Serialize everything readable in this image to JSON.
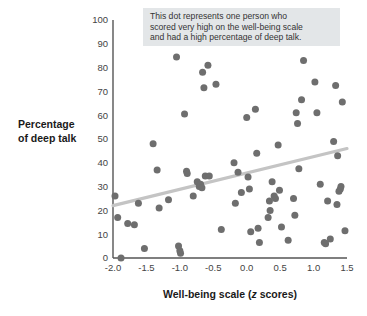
{
  "annotation": {
    "line1": "This dot represents one person who",
    "line2": "scored very high on the well-being scale",
    "line3": "and had a high percentage of deep talk.",
    "background": "#e3e6e8"
  },
  "colors": {
    "dot": "#6e6e6e",
    "trend_line": "#c4c4c4",
    "axis": "#555555",
    "tick_text": "#444444",
    "title_text": "#1a1a1a",
    "background": "#ffffff"
  },
  "chart_data": {
    "type": "scatter",
    "title": "",
    "xlabel": "Well-being scale (z scores)",
    "xlabel_plain": "Well-being scale (",
    "xlabel_italic": "z",
    "xlabel_tail": " scores)",
    "ylabel_line1": "Percentage",
    "ylabel_line2": "of deep talk",
    "xlim": [
      -2.0,
      1.5
    ],
    "ylim": [
      0,
      100
    ],
    "xticks": [
      -2.0,
      -1.5,
      -1.0,
      -0.5,
      0.0,
      0.5,
      1.0,
      1.5
    ],
    "xticklabels": [
      "-2.0",
      "-1.5",
      "-1.0",
      "-0.5",
      "0.0",
      "0.5",
      "1.0",
      "1.5"
    ],
    "yticks": [
      0,
      10,
      20,
      30,
      40,
      50,
      60,
      70,
      80,
      90,
      100
    ],
    "yticklabels": [
      "0",
      "10",
      "20",
      "30",
      "40",
      "50",
      "60",
      "70",
      "80",
      "90",
      "100"
    ],
    "grid": false,
    "legend": "none",
    "trend_line": {
      "x": [
        -2.0,
        1.5
      ],
      "y": [
        22.0,
        46.0
      ]
    },
    "points": [
      {
        "x": -1.97,
        "y": 26
      },
      {
        "x": -1.93,
        "y": 17
      },
      {
        "x": -1.88,
        "y": 0
      },
      {
        "x": -1.78,
        "y": 14.5
      },
      {
        "x": -1.68,
        "y": 14
      },
      {
        "x": -1.62,
        "y": 23
      },
      {
        "x": -1.53,
        "y": 4
      },
      {
        "x": -1.4,
        "y": 48
      },
      {
        "x": -1.34,
        "y": 37
      },
      {
        "x": -1.31,
        "y": 21
      },
      {
        "x": -1.17,
        "y": 24.5
      },
      {
        "x": -1.05,
        "y": 84.5
      },
      {
        "x": -1.02,
        "y": 5
      },
      {
        "x": -1.0,
        "y": 3
      },
      {
        "x": -0.99,
        "y": 2
      },
      {
        "x": -0.93,
        "y": 60.5
      },
      {
        "x": -0.9,
        "y": 36.5
      },
      {
        "x": -0.89,
        "y": 35.5
      },
      {
        "x": -0.8,
        "y": 26
      },
      {
        "x": -0.74,
        "y": 32
      },
      {
        "x": -0.71,
        "y": 30
      },
      {
        "x": -0.69,
        "y": 31
      },
      {
        "x": -0.67,
        "y": 29.5
      },
      {
        "x": -0.66,
        "y": 78
      },
      {
        "x": -0.64,
        "y": 71.5
      },
      {
        "x": -0.62,
        "y": 34.5
      },
      {
        "x": -0.58,
        "y": 81
      },
      {
        "x": -0.56,
        "y": 34.5
      },
      {
        "x": -0.46,
        "y": 73
      },
      {
        "x": -0.38,
        "y": 12
      },
      {
        "x": -0.19,
        "y": 40
      },
      {
        "x": -0.17,
        "y": 23
      },
      {
        "x": -0.13,
        "y": 36
      },
      {
        "x": -0.08,
        "y": 27.5
      },
      {
        "x": 0.0,
        "y": 59
      },
      {
        "x": 0.02,
        "y": 34
      },
      {
        "x": 0.04,
        "y": 29
      },
      {
        "x": 0.06,
        "y": 11
      },
      {
        "x": 0.13,
        "y": 62.5
      },
      {
        "x": 0.15,
        "y": 44
      },
      {
        "x": 0.17,
        "y": 12.5
      },
      {
        "x": 0.19,
        "y": 6.5
      },
      {
        "x": 0.32,
        "y": 17
      },
      {
        "x": 0.34,
        "y": 24
      },
      {
        "x": 0.35,
        "y": 20
      },
      {
        "x": 0.38,
        "y": 32
      },
      {
        "x": 0.41,
        "y": 26
      },
      {
        "x": 0.43,
        "y": 25
      },
      {
        "x": 0.47,
        "y": 47.5
      },
      {
        "x": 0.49,
        "y": 28.5
      },
      {
        "x": 0.52,
        "y": 13
      },
      {
        "x": 0.62,
        "y": 7.5
      },
      {
        "x": 0.7,
        "y": 25
      },
      {
        "x": 0.72,
        "y": 18
      },
      {
        "x": 0.74,
        "y": 61
      },
      {
        "x": 0.76,
        "y": 56.5
      },
      {
        "x": 0.78,
        "y": 37.5
      },
      {
        "x": 0.82,
        "y": 66.5
      },
      {
        "x": 0.85,
        "y": 83
      },
      {
        "x": 1.02,
        "y": 74
      },
      {
        "x": 1.05,
        "y": 61
      },
      {
        "x": 1.1,
        "y": 31
      },
      {
        "x": 1.16,
        "y": 6.5
      },
      {
        "x": 1.18,
        "y": 6
      },
      {
        "x": 1.21,
        "y": 24
      },
      {
        "x": 1.25,
        "y": 8
      },
      {
        "x": 1.3,
        "y": 49
      },
      {
        "x": 1.33,
        "y": 72.5
      },
      {
        "x": 1.35,
        "y": 22.5
      },
      {
        "x": 1.36,
        "y": 43
      },
      {
        "x": 1.38,
        "y": 28
      },
      {
        "x": 1.4,
        "y": 29
      },
      {
        "x": 1.41,
        "y": 30
      },
      {
        "x": 1.43,
        "y": 65.5
      },
      {
        "x": 1.47,
        "y": 11.5
      }
    ]
  }
}
